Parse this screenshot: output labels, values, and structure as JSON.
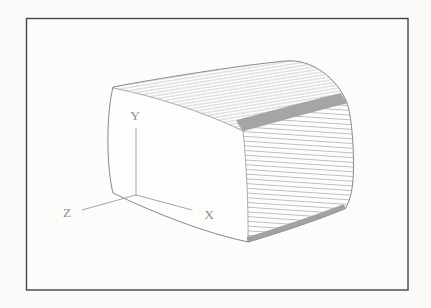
{
  "figure": {
    "axes": {
      "x_label": "X",
      "y_label": "Y",
      "z_label": "Z"
    }
  },
  "colors": {
    "paper": "#fafaf8",
    "frame_border": "#454545",
    "outline_ink": "#7a7a7a",
    "hatch_ink": "#9d9d9d",
    "band_fill": "#b4b4b4",
    "band_ink": "#7e7e7e",
    "axis_ink": "#9b9b9b",
    "label_ink": "#8f8f8f"
  }
}
